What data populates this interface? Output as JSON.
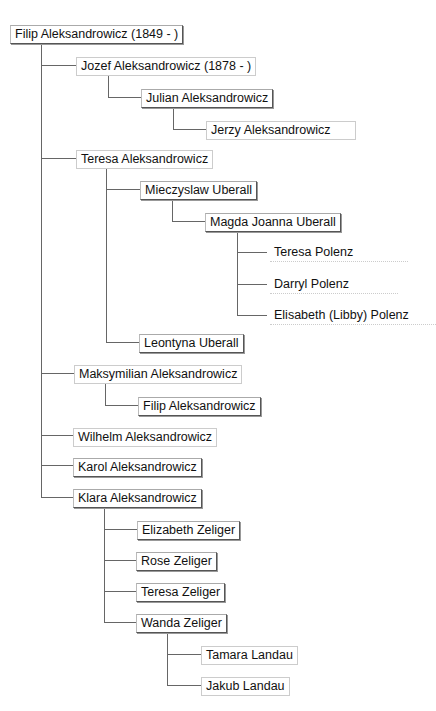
{
  "nodes": [
    {
      "id": "n0",
      "label": "Filip Aleksandrowicz (1849 - )",
      "x": 10,
      "y": 25,
      "style": "box"
    },
    {
      "id": "n1",
      "label": "Jozef Aleksandrowicz (1878 - )",
      "x": 76,
      "y": 57,
      "style": "faint"
    },
    {
      "id": "n2",
      "label": "Julian Aleksandrowicz",
      "x": 141,
      "y": 89,
      "style": "box"
    },
    {
      "id": "n3",
      "label": "Jerzy Aleksandrowicz",
      "x": 206,
      "y": 121,
      "style": "faint"
    },
    {
      "id": "n4",
      "label": "Teresa Aleksandrowicz",
      "x": 76,
      "y": 150,
      "style": "faint"
    },
    {
      "id": "n5",
      "label": "Mieczyslaw Uberall",
      "x": 140,
      "y": 181,
      "style": "box"
    },
    {
      "id": "n6",
      "label": "Magda Joanna Uberall",
      "x": 205,
      "y": 213,
      "style": "box"
    },
    {
      "id": "n7",
      "label": "Teresa Polenz",
      "x": 270,
      "y": 244,
      "style": "nobox"
    },
    {
      "id": "n8",
      "label": "Darryl Polenz",
      "x": 270,
      "y": 276,
      "style": "nobox"
    },
    {
      "id": "n9",
      "label": "Elisabeth (Libby) Polenz",
      "x": 270,
      "y": 307,
      "style": "nobox"
    },
    {
      "id": "n10",
      "label": "Leontyna Uberall",
      "x": 139,
      "y": 334,
      "style": "box"
    },
    {
      "id": "n11",
      "label": "Maksymilian Aleksandrowicz",
      "x": 74,
      "y": 365,
      "style": "faint"
    },
    {
      "id": "n12",
      "label": "Filip Aleksandrowicz",
      "x": 138,
      "y": 397,
      "style": "box"
    },
    {
      "id": "n13",
      "label": "Wilhelm Aleksandrowicz",
      "x": 73,
      "y": 428,
      "style": "faint"
    },
    {
      "id": "n14",
      "label": "Karol Aleksandrowicz",
      "x": 73,
      "y": 458,
      "style": "box"
    },
    {
      "id": "n15",
      "label": "Klara Aleksandrowicz",
      "x": 73,
      "y": 489,
      "style": "box"
    },
    {
      "id": "n16",
      "label": "Elizabeth Zeliger",
      "x": 137,
      "y": 521,
      "style": "box"
    },
    {
      "id": "n17",
      "label": "Rose Zeliger",
      "x": 136,
      "y": 552,
      "style": "box"
    },
    {
      "id": "n18",
      "label": "Teresa Zeliger",
      "x": 136,
      "y": 583,
      "style": "box"
    },
    {
      "id": "n19",
      "label": "Wanda Zeliger",
      "x": 136,
      "y": 614,
      "style": "box"
    },
    {
      "id": "n20",
      "label": "Tamara Landau",
      "x": 201,
      "y": 646,
      "style": "faint"
    },
    {
      "id": "n21",
      "label": "Jakub Landau",
      "x": 201,
      "y": 677,
      "style": "faint"
    }
  ]
}
